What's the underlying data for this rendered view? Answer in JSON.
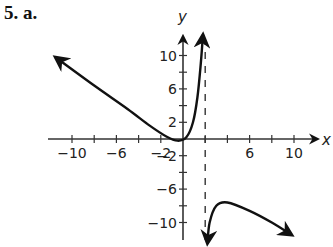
{
  "problem_label": "5. a.",
  "colors": {
    "ink": "#111111",
    "axis": "#333333",
    "background": "#ffffff"
  },
  "chart_data": {
    "type": "line",
    "title": "",
    "xlabel": "x",
    "ylabel": "y",
    "xlim": [
      -12,
      12
    ],
    "ylim": [
      -12,
      13
    ],
    "x_ticks": [
      -10,
      -6,
      -2,
      6,
      10
    ],
    "y_ticks": [
      10,
      6,
      2,
      -2,
      -6,
      -10
    ],
    "x_tick_labels": [
      "−10",
      "−6",
      "−2",
      "6",
      "10"
    ],
    "y_tick_labels": [
      "10",
      "6",
      "2",
      "−2",
      "−6",
      "−10"
    ],
    "vertical_asymptote": 2,
    "grid": false,
    "series": [
      {
        "name": "left branch",
        "points": [
          [
            -11.5,
            9.8
          ],
          [
            -8,
            6.4
          ],
          [
            -5,
            3.6
          ],
          [
            -3,
            1.6
          ],
          [
            -1.5,
            0.3
          ],
          [
            -0.5,
            -0.2
          ],
          [
            0.3,
            0.2
          ],
          [
            0.9,
            2
          ],
          [
            1.3,
            5
          ],
          [
            1.6,
            9
          ],
          [
            1.8,
            12.5
          ]
        ]
      },
      {
        "name": "right branch",
        "points": [
          [
            2.2,
            -12.5
          ],
          [
            2.4,
            -10
          ],
          [
            3,
            -8
          ],
          [
            4,
            -7.6
          ],
          [
            6,
            -8.6
          ],
          [
            8,
            -10
          ],
          [
            9.8,
            -11.5
          ]
        ]
      }
    ]
  }
}
